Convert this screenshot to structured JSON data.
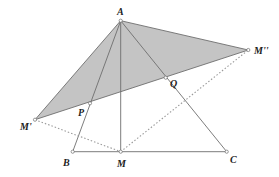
{
  "figure": {
    "type": "geometry-diagram",
    "colors": {
      "line": "#6e6e6e",
      "shade": "#c4c4c4",
      "dotted": "#9a9a9a",
      "point_fill": "#ffffff",
      "label": "#222222"
    },
    "points": [
      {
        "id": "A",
        "label": "A"
      },
      {
        "id": "B",
        "label": "B"
      },
      {
        "id": "M",
        "label": "M"
      },
      {
        "id": "C",
        "label": "C"
      },
      {
        "id": "M1",
        "label": "M'"
      },
      {
        "id": "M2",
        "label": "M''"
      },
      {
        "id": "P",
        "label": "P"
      },
      {
        "id": "Q",
        "label": "Q"
      }
    ],
    "shaded_triangle": [
      "A",
      "M1",
      "M2"
    ],
    "segments": [
      {
        "from": "A",
        "to": "B",
        "style": "solid"
      },
      {
        "from": "A",
        "to": "M",
        "style": "solid"
      },
      {
        "from": "A",
        "to": "C",
        "style": "solid"
      },
      {
        "from": "B",
        "to": "C",
        "style": "solid"
      },
      {
        "from": "A",
        "to": "M1",
        "style": "solid"
      },
      {
        "from": "A",
        "to": "M2",
        "style": "solid"
      },
      {
        "from": "M1",
        "to": "M2",
        "style": "solid"
      },
      {
        "from": "M1",
        "to": "M",
        "style": "dotted"
      },
      {
        "from": "M",
        "to": "M2",
        "style": "dotted"
      }
    ]
  }
}
